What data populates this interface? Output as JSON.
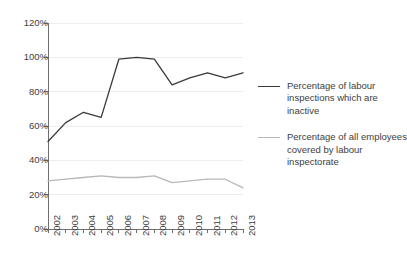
{
  "chart_data": {
    "type": "line",
    "title": "",
    "xlabel": "",
    "ylabel": "",
    "grid": true,
    "legend_position": "right",
    "categories": [
      "2002",
      "2003",
      "2004",
      "2005",
      "2006",
      "2007",
      "2008",
      "2009",
      "2010",
      "2011",
      "2012",
      "2013"
    ],
    "ylim": [
      0,
      120
    ],
    "ytick_labels": [
      "0%",
      "20%",
      "40%",
      "60%",
      "80%",
      "100%",
      "120%"
    ],
    "ytick_values": [
      0,
      20,
      40,
      60,
      80,
      100,
      120
    ],
    "series": [
      {
        "name": "Percentage of labour inspections which are inactive",
        "color": "#3a3a3a",
        "values": [
          51,
          62,
          68,
          65,
          99,
          100,
          99,
          84,
          88,
          91,
          88,
          91
        ]
      },
      {
        "name": "Percentage of all employees covered by labour inspectorate",
        "color": "#b8b8b8",
        "values": [
          28,
          29,
          30,
          31,
          30,
          30,
          31,
          27,
          28,
          29,
          29,
          24
        ]
      }
    ]
  },
  "legend": {
    "entries": [
      {
        "label": "Percentage of labour inspections which are inactive"
      },
      {
        "label": "Percentage of all employees covered by labour inspectorate"
      }
    ]
  },
  "colors": {
    "series_dark": "#3a3a3a",
    "series_light": "#b8b8b8",
    "axis": "#6e6e6e",
    "grid": "#ededed",
    "text": "#3d3d3d",
    "background": "#ffffff"
  }
}
